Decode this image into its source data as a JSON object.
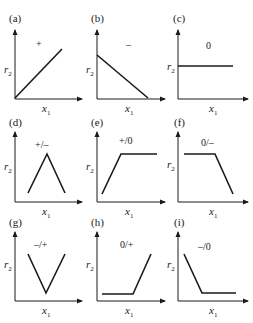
{
  "figure": {
    "y_axis_label": "r",
    "y_axis_sub": "2",
    "x_axis_label": "x",
    "x_axis_sub": "1",
    "panels": [
      {
        "id": "a",
        "label": "(a)",
        "sign": "+",
        "shape": "increasing"
      },
      {
        "id": "b",
        "label": "(b)",
        "sign": "–",
        "shape": "decreasing"
      },
      {
        "id": "c",
        "label": "(c)",
        "sign": "0",
        "shape": "constant"
      },
      {
        "id": "d",
        "label": "(d)",
        "sign": "+/–",
        "shape": "peak"
      },
      {
        "id": "e",
        "label": "(e)",
        "sign": "+/0",
        "shape": "increase-then-plateau"
      },
      {
        "id": "f",
        "label": "(f)",
        "sign": "0/–",
        "shape": "plateau-then-decrease"
      },
      {
        "id": "g",
        "label": "(g)",
        "sign": "–/+",
        "shape": "valley"
      },
      {
        "id": "h",
        "label": "(h)",
        "sign": "0/+",
        "shape": "plateau-then-increase"
      },
      {
        "id": "i",
        "label": "(i)",
        "sign": "–/0",
        "shape": "decrease-then-plateau"
      }
    ]
  },
  "colors": {
    "line": "#1a1a1a",
    "background": "#ffffff"
  }
}
